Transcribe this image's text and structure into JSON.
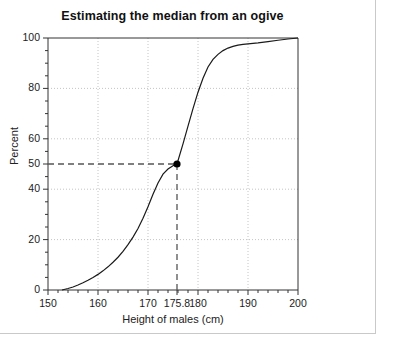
{
  "chart_data": {
    "type": "line",
    "title": "Estimating the median from an ogive",
    "xlabel": "Height of males (cm)",
    "ylabel": "Percent",
    "xlim": [
      150,
      200
    ],
    "ylim": [
      0,
      100
    ],
    "grid": true,
    "legend": "none",
    "x_ticks": [
      150,
      160,
      170,
      180,
      190,
      200
    ],
    "x_tick_labels": [
      "150",
      "160",
      "170",
      "180",
      "190",
      "200"
    ],
    "x_minor_tick_step": 2,
    "x_gridlines": [
      160,
      170,
      180,
      190
    ],
    "y_ticks": [
      0,
      20,
      40,
      50,
      60,
      80,
      100
    ],
    "y_tick_labels": [
      "0",
      "20",
      "40",
      "50",
      "60",
      "80",
      "100"
    ],
    "y_minor_tick_step": 5,
    "y_gridlines": [
      20,
      40,
      60,
      80
    ],
    "series": [
      {
        "name": "Cumulative percentage of males",
        "x": [
          152.8,
          154,
          155,
          156,
          157,
          158,
          159,
          160,
          161,
          162,
          163,
          164,
          165,
          166,
          167,
          168,
          169,
          170,
          171,
          172,
          173,
          174,
          175,
          175.8,
          177,
          178,
          179,
          180,
          181,
          182,
          183,
          184,
          185,
          186,
          187,
          188,
          189,
          190,
          192,
          194,
          196,
          198,
          200
        ],
        "y": [
          0,
          0.6,
          1.2,
          2,
          2.9,
          3.9,
          5,
          6.2,
          7.6,
          9.2,
          11,
          13,
          15.3,
          18,
          21,
          24.4,
          28.5,
          33,
          38,
          42.5,
          46,
          48,
          49.3,
          50,
          58,
          65,
          72,
          78.5,
          84,
          88.5,
          91.5,
          93.5,
          95,
          96,
          96.7,
          97.2,
          97.5,
          97.7,
          98.1,
          98.6,
          99.1,
          99.6,
          100
        ]
      }
    ],
    "annotation": {
      "label": "175.8",
      "x": 175.8,
      "y": 50,
      "marker": "filled-circle",
      "marker_color": "#000000",
      "guide_style": "dashed",
      "guide_color": "#555555"
    },
    "line_color": "#1a1a1a",
    "grid_color": "#b5b5b5",
    "axis_color": "#333333"
  }
}
